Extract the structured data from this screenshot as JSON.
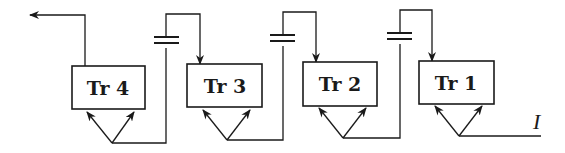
{
  "diagram": {
    "type": "cascaded transistor/triode stage chain",
    "stages": [
      {
        "id": "tr4",
        "label": "Tr 4"
      },
      {
        "id": "tr3",
        "label": "Tr 3"
      },
      {
        "id": "tr2",
        "label": "Tr 2"
      },
      {
        "id": "tr1",
        "label": "Tr 1"
      }
    ],
    "input_label": "I",
    "coupling_elements": [
      "capacitor",
      "capacitor",
      "capacitor"
    ],
    "output_direction": "left",
    "colors": {
      "line": "#1a1a1a",
      "background": "#ffffff"
    }
  }
}
